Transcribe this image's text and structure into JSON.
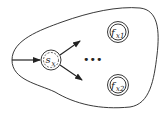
{
  "diagram": {
    "type": "automaton-fragment",
    "start_state": {
      "label": "s",
      "subscript": "x",
      "style": "dashed-inner-circle"
    },
    "final_states": [
      {
        "label": "f",
        "subscript": "x1",
        "style": "double-circle"
      },
      {
        "label": "f",
        "subscript": "x2",
        "style": "double-circle"
      }
    ],
    "ellipsis": "•••",
    "colors": {
      "stroke": "#222222",
      "background": "#ffffff"
    }
  }
}
